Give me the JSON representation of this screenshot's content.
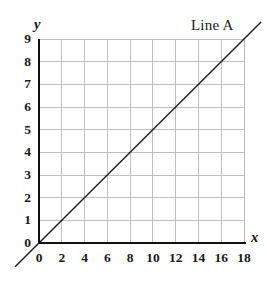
{
  "chart_data": {
    "type": "line",
    "title": "",
    "xlabel": "x",
    "ylabel": "y",
    "xlim": [
      0,
      18
    ],
    "ylim": [
      0,
      9
    ],
    "grid": true,
    "legend_position": "top-right",
    "background_color": "#ffffff",
    "line_color": "#222222",
    "grid_color": "#b8b8b8",
    "axis_color": "#111111",
    "x_ticks": [
      "0",
      "2",
      "4",
      "6",
      "8",
      "10",
      "12",
      "14",
      "16",
      "18"
    ],
    "x_tick_values": [
      0,
      2,
      4,
      6,
      8,
      10,
      12,
      14,
      16,
      18
    ],
    "y_ticks": [
      "0",
      "1",
      "2",
      "3",
      "4",
      "5",
      "6",
      "7",
      "8",
      "9"
    ],
    "y_tick_values": [
      0,
      1,
      2,
      3,
      4,
      5,
      6,
      7,
      8,
      9
    ],
    "series": [
      {
        "name": "Line A",
        "label": "Line A",
        "slope": 0.5,
        "intercept": 0,
        "equation": "y = x/2",
        "x": [
          0,
          2,
          4,
          6,
          8,
          10,
          12,
          14,
          16,
          18
        ],
        "values": [
          0,
          1,
          2,
          3,
          4,
          5,
          6,
          7,
          8,
          9
        ]
      }
    ],
    "annotations": [
      {
        "text": "Line A",
        "position": "upper-right"
      }
    ]
  },
  "axes": {
    "x_axis_label": "x",
    "y_axis_label": "y"
  },
  "legend": {
    "line_a_label": "Line A"
  }
}
